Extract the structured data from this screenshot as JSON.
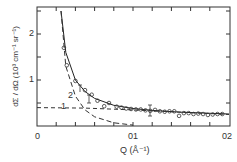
{
  "chart_data": {
    "type": "line",
    "title": "",
    "xlabel": "Q (Å⁻¹)",
    "ylabel": "dΣ / dΩ (10³ cm⁻¹ sr⁻¹)",
    "xlim": [
      0,
      0.2
    ],
    "ylim": [
      0,
      2.5
    ],
    "x_ticks": [
      "0",
      "0.1",
      "0.2"
    ],
    "x_tick_labels_shown": [
      "0",
      "01",
      "02"
    ],
    "y_ticks": [
      "1",
      "2"
    ],
    "grid": false,
    "legend": "none (curves annotated 1 and 2)",
    "series": [
      {
        "name": "data (circles)",
        "style": "markers",
        "x": [
          0.028,
          0.031,
          0.04,
          0.05,
          0.057,
          0.063,
          0.07,
          0.075,
          0.083,
          0.088,
          0.093,
          0.098,
          0.103,
          0.108,
          0.113,
          0.118,
          0.123,
          0.128,
          0.133,
          0.138,
          0.143,
          0.148,
          0.153,
          0.158,
          0.163,
          0.168,
          0.173,
          0.178,
          0.183,
          0.188,
          0.193
        ],
        "y": [
          1.7,
          1.32,
          0.98,
          0.78,
          0.68,
          0.55,
          0.43,
          0.5,
          0.42,
          0.4,
          0.38,
          0.37,
          0.36,
          0.36,
          0.34,
          0.33,
          0.35,
          0.32,
          0.31,
          0.32,
          0.32,
          0.22,
          0.28,
          0.28,
          0.26,
          0.27,
          0.26,
          0.24,
          0.25,
          0.26,
          0.26
        ]
      },
      {
        "name": "total fit",
        "style": "solid",
        "x": [
          0.025,
          0.03,
          0.04,
          0.05,
          0.06,
          0.08,
          0.1,
          0.12,
          0.15,
          0.2
        ],
        "y": [
          2.5,
          1.6,
          1.0,
          0.75,
          0.6,
          0.45,
          0.38,
          0.34,
          0.3,
          0.26
        ]
      },
      {
        "name": "1",
        "style": "dashed",
        "x": [
          0,
          0.05,
          0.1,
          0.15,
          0.2
        ],
        "y": [
          0.4,
          0.39,
          0.35,
          0.3,
          0.25
        ]
      },
      {
        "name": "2",
        "style": "dashed",
        "x": [
          0.025,
          0.03,
          0.04,
          0.05,
          0.06,
          0.08,
          0.1
        ],
        "y": [
          2.5,
          1.3,
          0.65,
          0.35,
          0.2,
          0.07,
          0.02
        ]
      }
    ],
    "annotations": [
      "1",
      "2"
    ]
  },
  "labels": {
    "x_tick_0": "0",
    "x_tick_1": "01",
    "x_tick_2": "02",
    "y_tick_1": "1",
    "y_tick_2": "2",
    "xlabel": "Q (Å⁻¹)",
    "ylabel": "dΣ / dΩ (10³ cm⁻¹ sr⁻¹)",
    "curve_1": "1",
    "curve_2": "2"
  }
}
